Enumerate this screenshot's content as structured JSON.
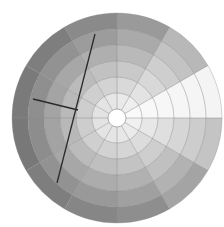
{
  "diagram": {
    "type": "polar-grid-wheel",
    "center": [
      117,
      118
    ],
    "outer_radius": 105,
    "center_hole_radius": 9,
    "rings": 6,
    "sectors": 12,
    "sector_angle_deg": 30,
    "shading_note": "gray levels darken outward; sector at 0-30 deg (right, above horizontal) is white",
    "sector_base_gray": [
      "#f4f4f4",
      "#b8b8b8",
      "#9a9a9a",
      "#8a8a8a",
      "#7e7e7e",
      "#7a7a7a",
      "#787878",
      "#7e7e7e",
      "#868686",
      "#8e8e8e",
      "#a4a4a4",
      "#c4c4c4"
    ],
    "grid_line_color": "#8c8c8c",
    "overlay_lines": [
      {
        "name": "long-line",
        "x1": 95,
        "y1": 34,
        "x2": 57,
        "y2": 183,
        "color": "#2a2a2a",
        "width": 1.3
      },
      {
        "name": "short-line",
        "x1": 33,
        "y1": 99,
        "x2": 78,
        "y2": 110,
        "color": "#2a2a2a",
        "width": 1.3
      }
    ]
  }
}
